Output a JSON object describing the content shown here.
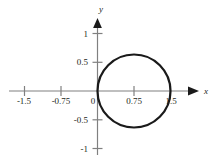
{
  "chart_data": {
    "type": "line",
    "title": "",
    "xlabel": "x",
    "ylabel": "y",
    "grid": false,
    "legend": "none",
    "xlim": [
      -1.95,
      2.05
    ],
    "ylim": [
      -1.35,
      1.3
    ],
    "xticks": [
      -1.5,
      -0.75,
      0,
      0.75,
      1.5
    ],
    "xticklabels": [
      "-1.5",
      "-0.75",
      "0",
      "0.75",
      "1.5"
    ],
    "yticks": [
      -1,
      -0.5,
      0.5,
      1
    ],
    "yticklabels": [
      "-1",
      "-0.5",
      "0.5",
      "1"
    ],
    "series": [
      {
        "name": "circle",
        "shape": "circle",
        "equation": "r = 1.5 cos(theta)",
        "center": [
          0.75,
          0
        ],
        "radius": 0.75,
        "color": "#1a1a1a",
        "linewidth": 2.2
      }
    ],
    "axis_color": "#808080",
    "text_color": "#231f20"
  },
  "axes": {
    "x_name": "x",
    "y_name": "y"
  },
  "ticks": {
    "x": [
      {
        "label": "-1.5",
        "value": -1.5
      },
      {
        "label": "-0.75",
        "value": -0.75
      },
      {
        "label": "0",
        "value": 0
      },
      {
        "label": "0.75",
        "value": 0.75
      },
      {
        "label": "1.5",
        "value": 1.5
      }
    ],
    "y": [
      {
        "label": "1",
        "value": 1
      },
      {
        "label": "0.5",
        "value": 0.5
      },
      {
        "label": "-0.5",
        "value": -0.5
      },
      {
        "label": "-1",
        "value": -1
      }
    ]
  }
}
